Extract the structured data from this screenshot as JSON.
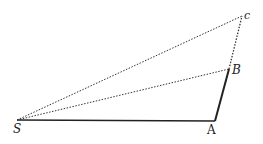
{
  "diagram": {
    "points": {
      "S": {
        "label": "S",
        "x": 17,
        "y": 120
      },
      "A": {
        "label": "A",
        "x": 215,
        "y": 121
      },
      "B": {
        "label": "B",
        "x": 229,
        "y": 69
      },
      "C": {
        "label": "c",
        "x": 242,
        "y": 16
      }
    },
    "segments": [
      {
        "from": "S",
        "to": "A",
        "style": "solid"
      },
      {
        "from": "A",
        "to": "B",
        "style": "solid-thick"
      },
      {
        "from": "S",
        "to": "B",
        "style": "dotted"
      },
      {
        "from": "S",
        "to": "C",
        "style": "dotted"
      },
      {
        "from": "B",
        "to": "C",
        "style": "dotted"
      }
    ],
    "colors": {
      "line": "#222222",
      "background": "#ffffff"
    }
  }
}
